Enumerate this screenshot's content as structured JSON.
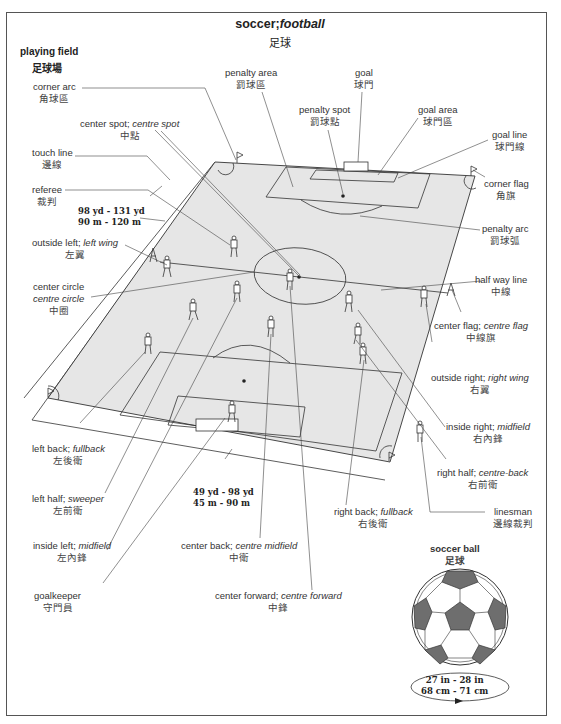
{
  "title": {
    "en": "soccer;",
    "en_italic": "football",
    "zh": "足球"
  },
  "playing_field": {
    "en": "playing field",
    "zh": "足球場"
  },
  "labels": {
    "corner_arc": {
      "en": "corner arc",
      "zh": "角球區"
    },
    "center_spot": {
      "en": "center spot; ",
      "en_alt": "centre spot",
      "zh": "中點"
    },
    "touch_line": {
      "en": "touch line",
      "zh": "邊線"
    },
    "referee": {
      "en": "referee",
      "zh": "裁判"
    },
    "outside_left": {
      "en": "outside left; ",
      "en_alt": "left wing",
      "zh": "左翼"
    },
    "center_circle": {
      "en": "center circle",
      "en_alt": "centre circle",
      "zh": "中圈"
    },
    "penalty_area": {
      "en": "penalty area",
      "zh": "罰球區"
    },
    "penalty_spot": {
      "en": "penalty spot",
      "zh": "罰球點"
    },
    "goal": {
      "en": "goal",
      "zh": "球門"
    },
    "goal_area": {
      "en": "goal area",
      "zh": "球門區"
    },
    "goal_line": {
      "en": "goal line",
      "zh": "球門線"
    },
    "corner_flag": {
      "en": "corner flag",
      "zh": "角旗"
    },
    "penalty_arc": {
      "en": "penalty arc",
      "zh": "罰球弧"
    },
    "half_way_line": {
      "en": "half way line",
      "zh": "中線"
    },
    "center_flag": {
      "en": "center flag; ",
      "en_alt": "centre flag",
      "zh": "中線旗"
    },
    "outside_right": {
      "en": "outside right; ",
      "en_alt": "right wing",
      "zh": "右翼"
    },
    "inside_right": {
      "en": "inside right; ",
      "en_alt": "midfield",
      "zh": "右內鋒"
    },
    "right_half": {
      "en": "right half; ",
      "en_alt": "centre-back",
      "zh": "右前衛"
    },
    "linesman": {
      "en": "linesman",
      "zh": "邊線裁判"
    },
    "right_back": {
      "en": "right back; ",
      "en_alt": "fullback",
      "zh": "右後衛"
    },
    "left_back": {
      "en": "left back; ",
      "en_alt": "fullback",
      "zh": "左後衛"
    },
    "left_half": {
      "en": "left half; ",
      "en_alt": "sweeper",
      "zh": "左前衛"
    },
    "inside_left": {
      "en": "inside left; ",
      "en_alt": "midfield",
      "zh": "左內鋒"
    },
    "goalkeeper": {
      "en": "goalkeeper",
      "zh": "守門員"
    },
    "center_back": {
      "en": "center back; ",
      "en_alt": "centre midfield",
      "zh": "中衛"
    },
    "center_forward": {
      "en": "center forward; ",
      "en_alt": "centre forward",
      "zh": "中鋒"
    }
  },
  "measurements": {
    "length": {
      "imperial": "98 yd - 131 yd",
      "metric": "90 m - 120 m"
    },
    "width": {
      "imperial": "49 yd - 98 yd",
      "metric": "45 m - 90 m"
    }
  },
  "soccer_ball": {
    "en": "soccer ball",
    "zh": "足球",
    "circumference": {
      "imperial": "27 in - 28 in",
      "metric": "68 cm - 71 cm"
    }
  },
  "colors": {
    "field": "#e6e6e6",
    "line": "#333333",
    "ball_patch": "#6e6e6e"
  }
}
